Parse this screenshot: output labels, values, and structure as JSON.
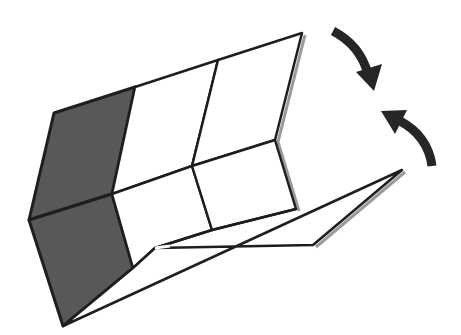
{
  "diagram": {
    "title": "Folded box with fold arrows",
    "colors": {
      "background": "#ffffff",
      "stroke": "#1e1e1e",
      "shade": "#585858",
      "shadow": "#9a9a9a",
      "arrow": "#262626"
    },
    "panels": [
      {
        "name": "shaded-top-left",
        "fill": "shade",
        "points": "54,113 135,87 112,194 29,220"
      },
      {
        "name": "shaded-bottom-left",
        "fill": "shade",
        "points": "29,220 112,194 133,268 63,326"
      },
      {
        "name": "back-upper-mid",
        "fill": "white",
        "points": "135,87 218,60 192,166 112,194"
      },
      {
        "name": "back-upper-right",
        "fill": "white",
        "points": "218,60 302,33 275,140 192,166"
      },
      {
        "name": "back-lower-mid",
        "fill": "white",
        "points": "112,194 192,166 212,230 155,248 133,268"
      },
      {
        "name": "back-lower-right",
        "fill": "white",
        "points": "192,166 275,140 296,209 212,230"
      },
      {
        "name": "front-flap",
        "fill": "white",
        "points": "133,268 155,248 313,245 402,170 63,326"
      }
    ],
    "arrows": [
      {
        "name": "fold-down-arrow",
        "direction": "clockwise-down"
      },
      {
        "name": "fold-up-arrow",
        "direction": "counterclockwise-up"
      }
    ]
  }
}
